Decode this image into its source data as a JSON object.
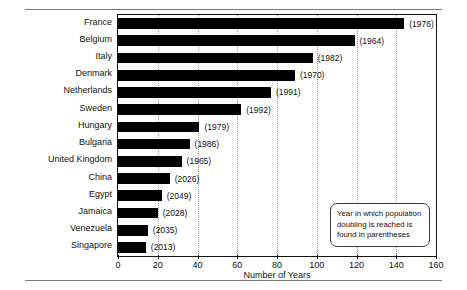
{
  "chart_data": {
    "type": "bar",
    "orientation": "horizontal",
    "title": "",
    "xlabel": "Number of Years",
    "ylabel": "",
    "xlim": [
      0,
      160
    ],
    "xticks": [
      0,
      20,
      40,
      60,
      80,
      100,
      120,
      140,
      160
    ],
    "grid": true,
    "legend_position": "inside-bottom-right",
    "annotation": "Year in which population doubling is reached is found in parentheses",
    "categories": [
      "France",
      "Belgium",
      "Italy",
      "Denmark",
      "Netherlands",
      "Sweden",
      "Hungary",
      "Bulgaria",
      "United Kingdom",
      "China",
      "Egypt",
      "Jamaica",
      "Venezuela",
      "Singapore"
    ],
    "values": [
      144,
      119,
      98,
      89,
      77,
      62,
      41,
      36,
      32,
      26,
      22,
      20,
      15,
      14
    ],
    "point_labels": [
      "(1976)",
      "(1964)",
      "(1982)",
      "(1970)",
      "(1991)",
      "(1992)",
      "(1979)",
      "(1986)",
      "(1965)",
      "(2026)",
      "(2049)",
      "(2028)",
      "(2035)",
      "(2013)"
    ],
    "bar_color": "#000000",
    "series": [
      {
        "name": "Years to population doubling",
        "values": [
          144,
          119,
          98,
          89,
          77,
          62,
          41,
          36,
          32,
          26,
          22,
          20,
          15,
          14
        ]
      }
    ]
  }
}
